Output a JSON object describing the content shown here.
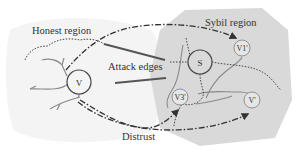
{
  "diagram": {
    "colors": {
      "honest_bg": "#f4f4f4",
      "sybil_bg": "#d9d9d9",
      "line": "#555555",
      "attack_edge": "#555555",
      "text": "#333333",
      "branch": "#8a8a8a"
    },
    "labels": {
      "honest_region": "Honest region",
      "sybil_region": "Sybil region",
      "attack_edges": "Attack edges",
      "distrust": "Distrust"
    },
    "nodes": [
      {
        "id": "V",
        "label": "V",
        "region": "honest"
      },
      {
        "id": "S",
        "label": "S",
        "region": "sybil"
      },
      {
        "id": "V1",
        "label": "V1'",
        "region": "sybil"
      },
      {
        "id": "V3",
        "label": "V3'",
        "region": "sybil"
      },
      {
        "id": "Vprime",
        "label": "V'",
        "region": "sybil"
      }
    ],
    "edges": [
      {
        "from": "V",
        "to": "V1",
        "style": "dash-dot",
        "arrow": true
      },
      {
        "from": "V",
        "to": "V3",
        "style": "dash-dot",
        "arrow": true
      },
      {
        "from": "V",
        "to": "Vprime",
        "style": "dash-dot",
        "arrow": true
      },
      {
        "type": "attack-edge",
        "style": "solid-thick"
      },
      {
        "type": "attack-edge",
        "style": "solid-thick"
      }
    ]
  }
}
